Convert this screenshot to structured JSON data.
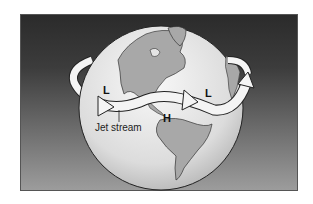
{
  "diagram": {
    "labels": {
      "low_west": "L",
      "high_center": "H",
      "low_east": "L",
      "jet_stream": "Jet stream"
    },
    "colors": {
      "background_top": "#2b2b2b",
      "background_bottom": "#9c9c9c",
      "globe": "#e6e6e6",
      "land": "#a8a8a8",
      "arrow": "#f4f4f4",
      "outline": "#222222"
    }
  }
}
